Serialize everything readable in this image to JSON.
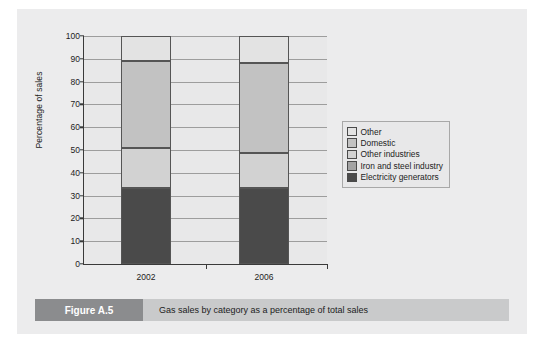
{
  "figure": {
    "tag": "Figure A.5",
    "caption": "Gas sales by category as a percentage of total sales"
  },
  "chart_data": {
    "type": "bar",
    "subtype": "stacked-100-percent",
    "title": "Gas sales by category as a percentage of total sales",
    "xlabel": "",
    "ylabel": "Percentage of sales",
    "ylim": [
      0,
      100
    ],
    "ytick_step": 10,
    "yticks": [
      0,
      10,
      20,
      30,
      40,
      50,
      60,
      70,
      80,
      90,
      100
    ],
    "grid": true,
    "grid_axis": "y",
    "legend_position": "right",
    "categories": [
      "2002",
      "2006"
    ],
    "series": [
      {
        "name": "Other",
        "color": "#e3e3e3",
        "values": [
          11,
          12
        ]
      },
      {
        "name": "Domestic",
        "color": "#c2c2c2",
        "values": [
          38,
          39.5
        ]
      },
      {
        "name": "Other industries",
        "color": "#d2d2d2",
        "values": [
          17.5,
          15
        ]
      },
      {
        "name": "Iron and steel industry",
        "color": "#a3a3a3",
        "values": [
          0,
          0
        ]
      },
      {
        "name": "Electricity generators",
        "color": "#4a4a4a",
        "values": [
          33.5,
          33.5
        ]
      }
    ],
    "stack_order_bottom_to_top": [
      "Electricity generators",
      "Iron and steel industry",
      "Other industries",
      "Domestic",
      "Other"
    ],
    "legend_entries": [
      {
        "label": "Other",
        "color": "#e3e3e3"
      },
      {
        "label": "Domestic",
        "color": "#c2c2c2"
      },
      {
        "label": "Other industries",
        "color": "#d2d2d2"
      },
      {
        "label": "Iron and steel industry",
        "color": "#a3a3a3"
      },
      {
        "label": "Electricity generators",
        "color": "#4a4a4a"
      }
    ]
  }
}
